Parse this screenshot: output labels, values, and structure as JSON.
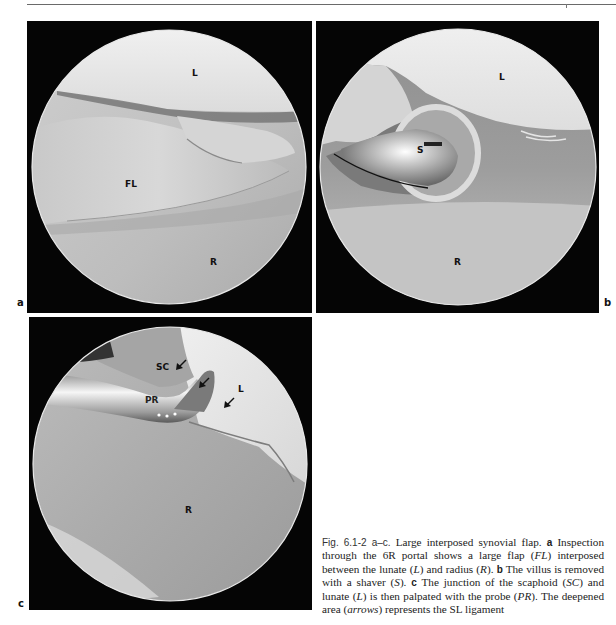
{
  "page": {
    "header_rule": true
  },
  "figure": {
    "panels": [
      {
        "id": "a",
        "letter": "a",
        "labels": {
          "L": "L",
          "FL": "FL",
          "R": "R"
        }
      },
      {
        "id": "b",
        "letter": "b",
        "labels": {
          "L": "L",
          "S": "S",
          "R": "R"
        }
      },
      {
        "id": "c",
        "letter": "c",
        "labels": {
          "SC": "SC",
          "PR": "PR",
          "L": "L",
          "R": "R"
        },
        "arrow_count": 3
      }
    ],
    "caption": {
      "fig_ref": "Fig. 6.1-2 a–c.",
      "title": " Large interposed synovial flap. ",
      "part_a_marker": "a",
      "part_a_text_1": " Inspection through the 6R portal shows a large flap (",
      "part_a_abbr_1": "FL",
      "part_a_text_2": ") interposed between the lunate (",
      "part_a_abbr_2": "L",
      "part_a_text_3": ") and radius (",
      "part_a_abbr_3": "R",
      "part_a_text_4": "). ",
      "part_b_marker": "b",
      "part_b_text_1": " The villus is removed with a shaver (",
      "part_b_abbr_1": "S",
      "part_b_text_2": "). ",
      "part_c_marker": "c",
      "part_c_text_1": " The junction of the scaphoid (",
      "part_c_abbr_1": "SC",
      "part_c_text_2": ") and lunate (",
      "part_c_abbr_2": "L",
      "part_c_text_3": ") is then palpated with the probe (",
      "part_c_abbr_3": "PR",
      "part_c_text_4": "). The deepened area (",
      "part_c_abbr_4": "arrows",
      "part_c_text_5": ") represents the SL ligament"
    }
  },
  "colors": {
    "panel_background": "#050505",
    "rule": "#6a6a6a",
    "text": "#222222"
  }
}
